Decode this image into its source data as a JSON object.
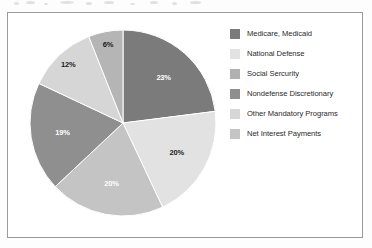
{
  "chart_data": {
    "type": "pie",
    "title": "",
    "subtitle": "",
    "xlabel": "",
    "ylabel": "",
    "legend_position": "right",
    "grid": false,
    "categories": [
      "Medicare, Medicaid",
      "National Defense",
      "Social Sercurity",
      "Nondefense Discretionary",
      "Other Mandatory Programs",
      "Net Interest Payments"
    ],
    "values": [
      23,
      20,
      20,
      19,
      12,
      6
    ],
    "labels": [
      "23%",
      "20%",
      "20%",
      "19%",
      "12%",
      "6%"
    ],
    "colors": [
      "#7b7b7b",
      "#e2e2e2",
      "#c4c4c4",
      "#8f8f8f",
      "#d6d6d6",
      "#b5b5b5"
    ],
    "label_colors": [
      "#ffffff",
      "#1c1c1c",
      "#ffffff",
      "#ffffff",
      "#1c1c1c",
      "#1c1c1c"
    ],
    "start_angle_deg": 0,
    "direction": "clockwise"
  },
  "figure": {
    "frame_color": "#9a9a9a",
    "background": "#ffffff"
  },
  "legend": {
    "entries": [
      {
        "label": "Medicare, Medicaid",
        "color": "#7b7b7b",
        "swatch_name": "legend-swatch-medicare-medicaid"
      },
      {
        "label": "National Defense",
        "color": "#e2e2e2",
        "swatch_name": "legend-swatch-national-defense"
      },
      {
        "label": "Social Sercurity",
        "color": "#b0b0b0",
        "swatch_name": "legend-swatch-social-sercurity"
      },
      {
        "label": "Nondefense Discretionary",
        "color": "#8f8f8f",
        "swatch_name": "legend-swatch-nondefense-discretionary"
      },
      {
        "label": "Other Mandatory Programs",
        "color": "#d6d6d6",
        "swatch_name": "legend-swatch-other-mandatory-programs"
      },
      {
        "label": "Net Interest Payments",
        "color": "#c4c4c4",
        "swatch_name": "legend-swatch-net-interest-payments"
      }
    ]
  },
  "pie_labels": {
    "medicare_medicaid": "23%",
    "national_defense": "20%",
    "social_sercurity": "20%",
    "nondefense_discretionary": "19%",
    "other_mandatory_programs": "12%",
    "net_interest_payments": "6%"
  }
}
